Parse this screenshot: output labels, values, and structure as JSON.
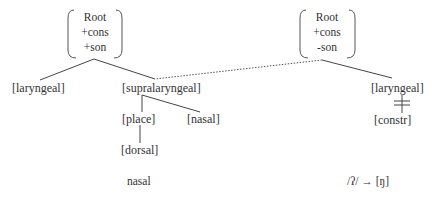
{
  "left_tree": {
    "root": {
      "lines": [
        "Root",
        "+cons",
        "+son"
      ]
    },
    "laryngeal": "[laryngeal]",
    "supralaryngeal": "[supralaryngeal]",
    "place": "[place]",
    "nasal": "[nasal]",
    "dorsal": "[dorsal]",
    "caption": "nasal"
  },
  "right_tree": {
    "root": {
      "lines": [
        "Root",
        "+cons",
        "-son"
      ]
    },
    "laryngeal": "[laryngeal]",
    "constr": "[constr]",
    "caption": "/ʔ/ → [ŋ]"
  },
  "connections": {
    "spreading_link": "dotted line from right Root to [supralaryngeal]",
    "delinked": "[laryngeal] to [constr] crossed out"
  }
}
